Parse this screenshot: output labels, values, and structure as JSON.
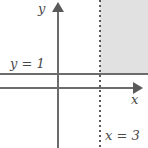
{
  "figure": {
    "background_color": "#ffffff",
    "axis_color": "#6c6c6c",
    "line_color": "#6c6c6c",
    "shading_color": "#e1e1e1",
    "label_color": "#4a4a4a"
  },
  "axes": {
    "y_axis_label": "y",
    "x_axis_label": "x",
    "y_axis_name": "vertical-axis",
    "x_axis_name": "horizontal-axis",
    "y_axis_arrow": "arrow-up",
    "x_axis_arrow": "arrow-right"
  },
  "lines": [
    {
      "label": "y = 1",
      "orientation": "horizontal",
      "style": "solid",
      "value": 1,
      "variable": "y"
    },
    {
      "label": "x = 3",
      "orientation": "vertical",
      "style": "dashed",
      "value": 3,
      "variable": "x"
    }
  ],
  "region": {
    "description": "shaded-region",
    "fill": "#e1e1e1",
    "bounded_below_by": "y = 1",
    "bounded_left_by": "x = 3",
    "quadrant": "upper-right"
  },
  "chart_data": {
    "type": "line",
    "title": "",
    "xlabel": "x",
    "ylabel": "y",
    "grid": false,
    "legend": "none",
    "series": [
      {
        "name": "y = 1",
        "type": "horizontal-line",
        "value": 1,
        "style": "solid",
        "label": "y = 1"
      },
      {
        "name": "x = 3",
        "type": "vertical-line",
        "value": 3,
        "style": "dashed",
        "label": "x = 3"
      }
    ],
    "shaded_regions": [
      {
        "name": "solution-region",
        "x_range": [
          3,
          null
        ],
        "y_range": [
          1,
          null
        ],
        "fill": "#e1e1e1"
      }
    ]
  }
}
